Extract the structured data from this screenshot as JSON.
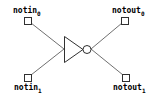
{
  "diagram": {
    "type": "schematic",
    "component": "inverter",
    "stroke_color": "#000000",
    "wire_color": "#707070",
    "pins": [
      {
        "id": "notin0",
        "name": "notin",
        "index": "0",
        "side": "input"
      },
      {
        "id": "notin1",
        "name": "notin",
        "index": "1",
        "side": "input"
      },
      {
        "id": "notout0",
        "name": "notout",
        "index": "0",
        "side": "output"
      },
      {
        "id": "notout1",
        "name": "notout",
        "index": "1",
        "side": "output"
      }
    ]
  }
}
